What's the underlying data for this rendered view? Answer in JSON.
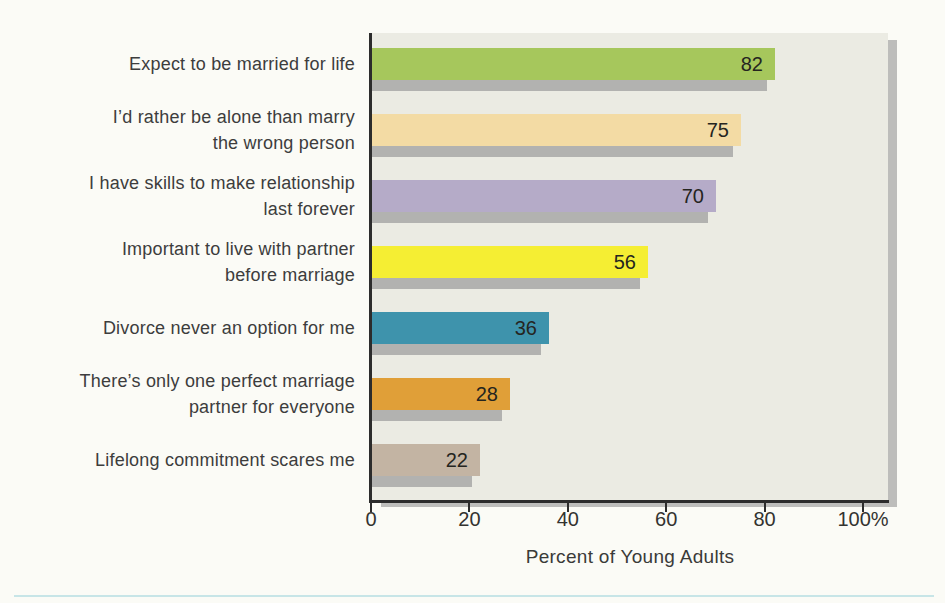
{
  "chart_data": {
    "type": "bar",
    "orientation": "horizontal",
    "title": "",
    "xlabel": "Percent of Young Adults",
    "ylabel": "",
    "xlim": [
      0,
      105
    ],
    "grid": false,
    "legend": null,
    "value_label_position": "inside-end",
    "categories": [
      "Expect to be married for life",
      "I’d rather be alone than marry the wrong person",
      "I have skills to make relationship last forever",
      "Important to live with partner before marriage",
      "Divorce never an option for me",
      "There’s only one perfect marriage partner for everyone",
      "Lifelong commitment scares me"
    ],
    "category_lines": [
      [
        "Expect to be married for life"
      ],
      [
        "I’d rather be alone than marry",
        "the wrong person"
      ],
      [
        "I have skills to make relationship",
        "last forever"
      ],
      [
        "Important to live with partner",
        "before marriage"
      ],
      [
        "Divorce never an option for me"
      ],
      [
        "There’s only one perfect marriage",
        "partner for everyone"
      ],
      [
        "Lifelong commitment scares me"
      ]
    ],
    "values": [
      82,
      75,
      70,
      56,
      36,
      28,
      22
    ],
    "value_labels": [
      "82",
      "75",
      "70",
      "56",
      "36",
      "28",
      "22"
    ],
    "bar_colors": [
      "#a6c75c",
      "#f3dba4",
      "#b5abc8",
      "#f5ee33",
      "#3e93ac",
      "#e09f38",
      "#c3b4a3"
    ],
    "bar_shadow_color": "#b2b2b0",
    "x_ticks": [
      "0",
      "20",
      "40",
      "60",
      "80",
      "100%"
    ],
    "x_tick_values": [
      0,
      20,
      40,
      60,
      80,
      100
    ]
  },
  "colors": {
    "page_background": "#fbfbf6",
    "plot_background": "#ebebe3",
    "axis": "#2c2c2c",
    "label_text": "#3d3d3d",
    "value_text": "#25251f",
    "panel_shadow": "#bdbdbb",
    "bottom_rule": "#b6dde2"
  }
}
